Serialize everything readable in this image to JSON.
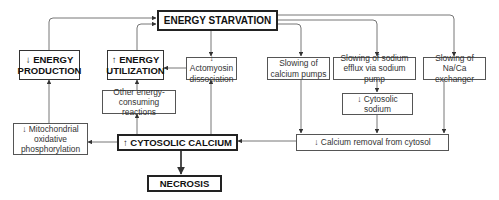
{
  "diagram": {
    "nodes": {
      "energy_starvation": "ENERGY STARVATION",
      "energy_production": "↓ ENERGY PRODUCTION",
      "energy_utilization": "↑ ENERGY UTILIZATION",
      "actomyosin": "↓ Actomyosin dissociation",
      "calcium_pumps": "Slowing of calcium pumps",
      "sodium_efflux": "Slowing of sodium efflux via sodium pump",
      "naca_exchanger": "Slowing of Na/Ca exchanger",
      "other_reactions": "Other energy-consuming reactions",
      "mitochondrial": "↓ Mitochondrial oxidative phosphorylation",
      "cytosolic_calcium": "↑ CYTOSOLIC CALCIUM",
      "cytosolic_sodium": "↓ Cytosolic sodium",
      "calcium_removal": "↓ Calcium removal from cytosol",
      "necrosis": "NECROSIS"
    },
    "edges": [
      [
        "energy_production",
        "energy_starvation"
      ],
      [
        "energy_utilization",
        "energy_starvation"
      ],
      [
        "energy_starvation",
        "actomyosin"
      ],
      [
        "energy_starvation",
        "calcium_pumps"
      ],
      [
        "energy_starvation",
        "sodium_efflux"
      ],
      [
        "energy_starvation",
        "naca_exchanger"
      ],
      [
        "actomyosin",
        "energy_utilization"
      ],
      [
        "other_reactions",
        "energy_utilization"
      ],
      [
        "cytosolic_calcium",
        "other_reactions"
      ],
      [
        "cytosolic_calcium",
        "actomyosin"
      ],
      [
        "cytosolic_calcium",
        "mitochondrial"
      ],
      [
        "mitochondrial",
        "energy_production"
      ],
      [
        "sodium_efflux",
        "cytosolic_sodium"
      ],
      [
        "cytosolic_sodium",
        "calcium_removal"
      ],
      [
        "calcium_pumps",
        "calcium_removal"
      ],
      [
        "naca_exchanger",
        "calcium_removal"
      ],
      [
        "calcium_removal",
        "cytosolic_calcium"
      ],
      [
        "cytosolic_calcium",
        "necrosis"
      ]
    ],
    "colors": {
      "line": "#555555",
      "text": "#222222",
      "background": "#ffffff"
    }
  }
}
